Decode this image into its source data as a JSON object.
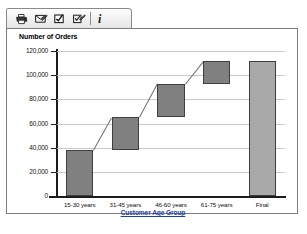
{
  "toolbar": {
    "buttons": [
      {
        "name": "print-icon",
        "title": "Print"
      },
      {
        "name": "email-icon",
        "title": "Email"
      },
      {
        "name": "edit-check-icon",
        "title": "Edit"
      },
      {
        "name": "copy-icon",
        "title": "Copy"
      }
    ],
    "separator": "|",
    "info_label": "i",
    "info_title": "Info"
  },
  "chart_data": {
    "type": "bar",
    "chart_style": "waterfall",
    "title": "",
    "xlabel": "Customer Age Group",
    "ylabel": "Number of Orders",
    "categories": [
      "15-30 years",
      "31-45 years",
      "46-60 years",
      "61-75 years",
      "Final"
    ],
    "ylim": [
      0,
      120000
    ],
    "y_ticks": [
      0,
      20000,
      40000,
      60000,
      80000,
      100000,
      120000
    ],
    "y_tick_labels": [
      "0",
      "20,000",
      "40,000",
      "60,000",
      "80,000",
      "100,000",
      "120,000"
    ],
    "grid": true,
    "legend": "none",
    "bar_color": "#808080",
    "total_bar_color": "#a9a9a9",
    "bar_border_color": "#3f3f3f",
    "connector_color": "#6e6e6e",
    "bars": [
      {
        "label": "15-30 years",
        "base": 0,
        "top": 38000,
        "value": 38000,
        "is_total": false
      },
      {
        "label": "31-45 years",
        "base": 38000,
        "top": 65000,
        "value": 27000,
        "is_total": false
      },
      {
        "label": "46-60 years",
        "base": 65000,
        "top": 93000,
        "value": 28000,
        "is_total": false
      },
      {
        "label": "61-75 years",
        "base": 93000,
        "top": 112000,
        "value": 19000,
        "is_total": false
      },
      {
        "label": "Final",
        "base": 0,
        "top": 112000,
        "value": 112000,
        "is_total": true
      }
    ],
    "cumulative": [
      38000,
      65000,
      93000,
      112000,
      112000
    ]
  }
}
